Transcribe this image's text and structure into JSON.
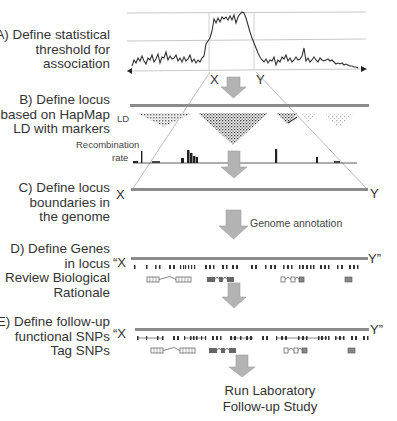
{
  "steps": [
    {
      "id": "A",
      "lines": [
        "A) Define statistical",
        "threshold for",
        "association"
      ]
    },
    {
      "id": "B",
      "lines": [
        "B)       Define locus",
        "based on HapMap",
        "LD with markers"
      ]
    },
    {
      "id": "C",
      "lines": [
        "C)       Define locus",
        "boundaries in",
        "the genome"
      ]
    },
    {
      "id": "D",
      "lines": [
        "D)      Define Genes",
        "in locus",
        "Review Biological",
        "Rationale"
      ]
    },
    {
      "id": "E",
      "lines": [
        "E)  Define follow-up",
        "functional SNPs",
        "Tag SNPs"
      ]
    }
  ],
  "labels": {
    "ld": "LD",
    "recombination_line1": "Recombination",
    "recombination_line2": "rate",
    "genome_annotation": "Genome annotation",
    "x_a": "X",
    "y_a": "Y",
    "x_c": "X",
    "y_c": "Y",
    "x_d": "“X",
    "y_d": "Y”",
    "x_e": "“X",
    "y_e": "Y”"
  },
  "final_step": {
    "line1": "Run Laboratory",
    "line2": "Follow-up Study"
  },
  "colors": {
    "arrow_fill": "#b3b3b3",
    "arrow_stroke": "#9a9a9a",
    "genome_bar": "#8c8c8c",
    "threshold_lines": "#c8c8c8",
    "signal": "#333333"
  }
}
